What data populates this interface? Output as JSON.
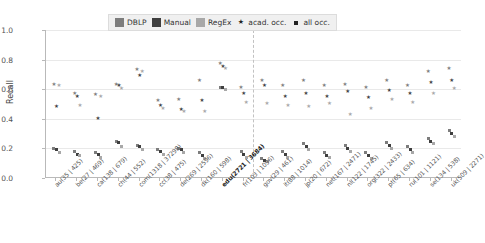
{
  "chart_data": {
    "type": "scatter",
    "title": "",
    "xlabel": "",
    "ylabel": "Recall",
    "ylim": [
      0.0,
      1.0
    ],
    "yticks": [
      "0.0",
      "0.2",
      "0.4",
      "0.6",
      "0.8",
      "1.0"
    ],
    "ytick_values": [
      0.0,
      0.2,
      0.4,
      0.6,
      0.8,
      1.0
    ],
    "grid": true,
    "legend_position": "top-center",
    "highlight_category": "edu(2721 | 3684)",
    "categories": [
      "au(35 | 425)",
      "be(27 | 469)",
      "ca(138 | 679)",
      "ch(44 | 552)",
      "com(1318 | 37298)",
      "cc(38 | 475)",
      "de(269 | 2596)",
      "dk(160 | 598)",
      "edu(2721 | 3684)",
      "fr(103 | 1096)",
      "gov(29 | 461)",
      "it(88 | 1014)",
      "jp(20 | 672)",
      "net(167 | 2471)",
      "nl(122 | 1745)",
      "org(322 | 2433)",
      "pt(65 | 634)",
      "ru(101 | 1121)",
      "se(134 | 538)",
      "uk(509 | 2271)"
    ],
    "series": [
      {
        "name": "DBLP",
        "marker": "acad. occ.",
        "color": "#7d7d7d",
        "values": [
          0.63,
          0.57,
          0.56,
          0.63,
          0.73,
          0.52,
          0.53,
          0.66,
          0.77,
          0.61,
          0.66,
          0.62,
          0.66,
          0.62,
          0.63,
          0.61,
          0.66,
          0.62,
          0.72,
          0.74
        ]
      },
      {
        "name": "Manual",
        "marker": "acad. occ.",
        "color": "#3f3f3f",
        "values": [
          0.48,
          0.55,
          0.4,
          0.62,
          0.69,
          0.49,
          0.46,
          0.52,
          0.75,
          0.57,
          0.62,
          0.55,
          0.57,
          0.55,
          0.58,
          0.54,
          0.59,
          0.57,
          0.64,
          0.66
        ]
      },
      {
        "name": "RegEx",
        "marker": "acad. occ.",
        "color": "#a8a8a8",
        "values": [
          0.62,
          0.49,
          0.55,
          0.6,
          0.72,
          0.47,
          0.45,
          0.45,
          0.74,
          0.51,
          0.5,
          0.49,
          0.48,
          0.5,
          0.43,
          0.47,
          0.53,
          0.51,
          0.57,
          0.6
        ]
      },
      {
        "name": "DBLP",
        "marker": "all occ.",
        "color": "#7d7d7d",
        "values": [
          0.2,
          0.18,
          0.17,
          0.25,
          0.22,
          0.19,
          0.2,
          0.17,
          0.61,
          0.18,
          0.13,
          0.18,
          0.23,
          0.17,
          0.22,
          0.17,
          0.24,
          0.21,
          0.27,
          0.32
        ]
      },
      {
        "name": "Manual",
        "marker": "all occ.",
        "color": "#3f3f3f",
        "values": [
          0.19,
          0.16,
          0.16,
          0.24,
          0.21,
          0.18,
          0.19,
          0.15,
          0.61,
          0.16,
          0.12,
          0.16,
          0.21,
          0.15,
          0.2,
          0.15,
          0.22,
          0.19,
          0.25,
          0.3
        ]
      },
      {
        "name": "RegEx",
        "marker": "all occ.",
        "color": "#a8a8a8",
        "values": [
          0.17,
          0.15,
          0.14,
          0.21,
          0.19,
          0.16,
          0.17,
          0.13,
          0.6,
          0.14,
          0.11,
          0.14,
          0.19,
          0.14,
          0.18,
          0.13,
          0.2,
          0.17,
          0.23,
          0.28
        ]
      }
    ]
  },
  "legend": {
    "items": [
      {
        "label": "DBLP",
        "kind": "swatch",
        "color": "#7d7d7d",
        "icon": "square-swatch-icon"
      },
      {
        "label": "Manual",
        "kind": "swatch",
        "color": "#3f3f3f",
        "icon": "square-swatch-icon"
      },
      {
        "label": "RegEx",
        "kind": "swatch",
        "color": "#a8a8a8",
        "icon": "square-swatch-icon"
      },
      {
        "label": "acad. occ.",
        "kind": "star",
        "color": "#222222",
        "icon": "star-marker-icon"
      },
      {
        "label": "all occ.",
        "kind": "square",
        "color": "#222222",
        "icon": "square-marker-icon"
      }
    ]
  },
  "colors": {
    "dblp": "#7d7d7d",
    "manual": "#3f3f3f",
    "regex": "#a8a8a8",
    "grid": "#e9e9e9",
    "axis": "#b9b9b9",
    "legend_bg": "#f0f0f0",
    "divider": "#c2c2c2"
  }
}
